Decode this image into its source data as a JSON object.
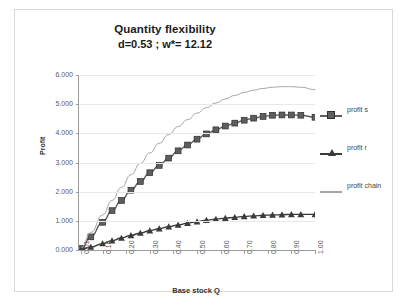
{
  "chart": {
    "title": "Quantity flexibility",
    "subtitle": "d=0.53 ;   w*= 12.12",
    "x_axis_title": "Base stock Q",
    "y_axis_title": "Profit"
  },
  "legend": {
    "items": [
      {
        "label": "profit s",
        "marker": "square-marker",
        "color": "#5e5e5e"
      },
      {
        "label": "profit r",
        "marker": "triangle-marker",
        "color": "#3a3a3a"
      },
      {
        "label": "profit chain",
        "marker": "line-marker",
        "color": "#a6a6a6"
      }
    ]
  },
  "chart_data": {
    "type": "line",
    "title": "Quantity flexibility",
    "subtitle": "d=0.53 ;   w*= 12.12",
    "xlabel": "Base stock Q",
    "ylabel": "Profit",
    "ylim": [
      0,
      6
    ],
    "ytick_labels": [
      "6.000",
      "5.000",
      "4.000",
      "3.000",
      "2.000",
      "1.000",
      "0.000"
    ],
    "ytick_values": [
      6,
      5,
      4,
      3,
      2,
      1,
      0
    ],
    "grid": true,
    "legend_position": "right",
    "xtick_labels": [
      "0.01",
      "0.10",
      "0.20",
      "0.30",
      "0.40",
      "0.50",
      "0.60",
      "0.70",
      "0.80",
      "0.90",
      "1.00"
    ],
    "x": [
      0.01,
      0.05,
      0.1,
      0.14,
      0.18,
      0.22,
      0.26,
      0.3,
      0.34,
      0.38,
      0.42,
      0.46,
      0.5,
      0.54,
      0.58,
      0.62,
      0.66,
      0.7,
      0.74,
      0.78,
      0.82,
      0.86,
      0.9,
      0.94,
      1.0
    ],
    "series": [
      {
        "name": "profit s",
        "marker": "square",
        "color": "#5e5e5e",
        "values": [
          0.05,
          0.45,
          0.95,
          1.35,
          1.7,
          2.05,
          2.35,
          2.65,
          2.9,
          3.15,
          3.4,
          3.6,
          3.8,
          3.98,
          4.12,
          4.25,
          4.35,
          4.45,
          4.52,
          4.58,
          4.62,
          4.63,
          4.63,
          4.62,
          4.55
        ]
      },
      {
        "name": "profit r",
        "marker": "triangle",
        "color": "#3a3a3a",
        "values": [
          0.02,
          0.1,
          0.22,
          0.32,
          0.41,
          0.5,
          0.58,
          0.66,
          0.73,
          0.8,
          0.86,
          0.92,
          0.97,
          1.02,
          1.06,
          1.09,
          1.12,
          1.15,
          1.17,
          1.19,
          1.2,
          1.21,
          1.22,
          1.22,
          1.22
        ]
      },
      {
        "name": "profit chain",
        "marker": "none",
        "color": "#a6a6a6",
        "values": [
          0.08,
          0.6,
          1.2,
          1.7,
          2.15,
          2.58,
          2.97,
          3.33,
          3.66,
          3.96,
          4.23,
          4.47,
          4.69,
          4.88,
          5.04,
          5.18,
          5.3,
          5.4,
          5.48,
          5.54,
          5.58,
          5.6,
          5.6,
          5.58,
          5.5
        ]
      }
    ]
  }
}
